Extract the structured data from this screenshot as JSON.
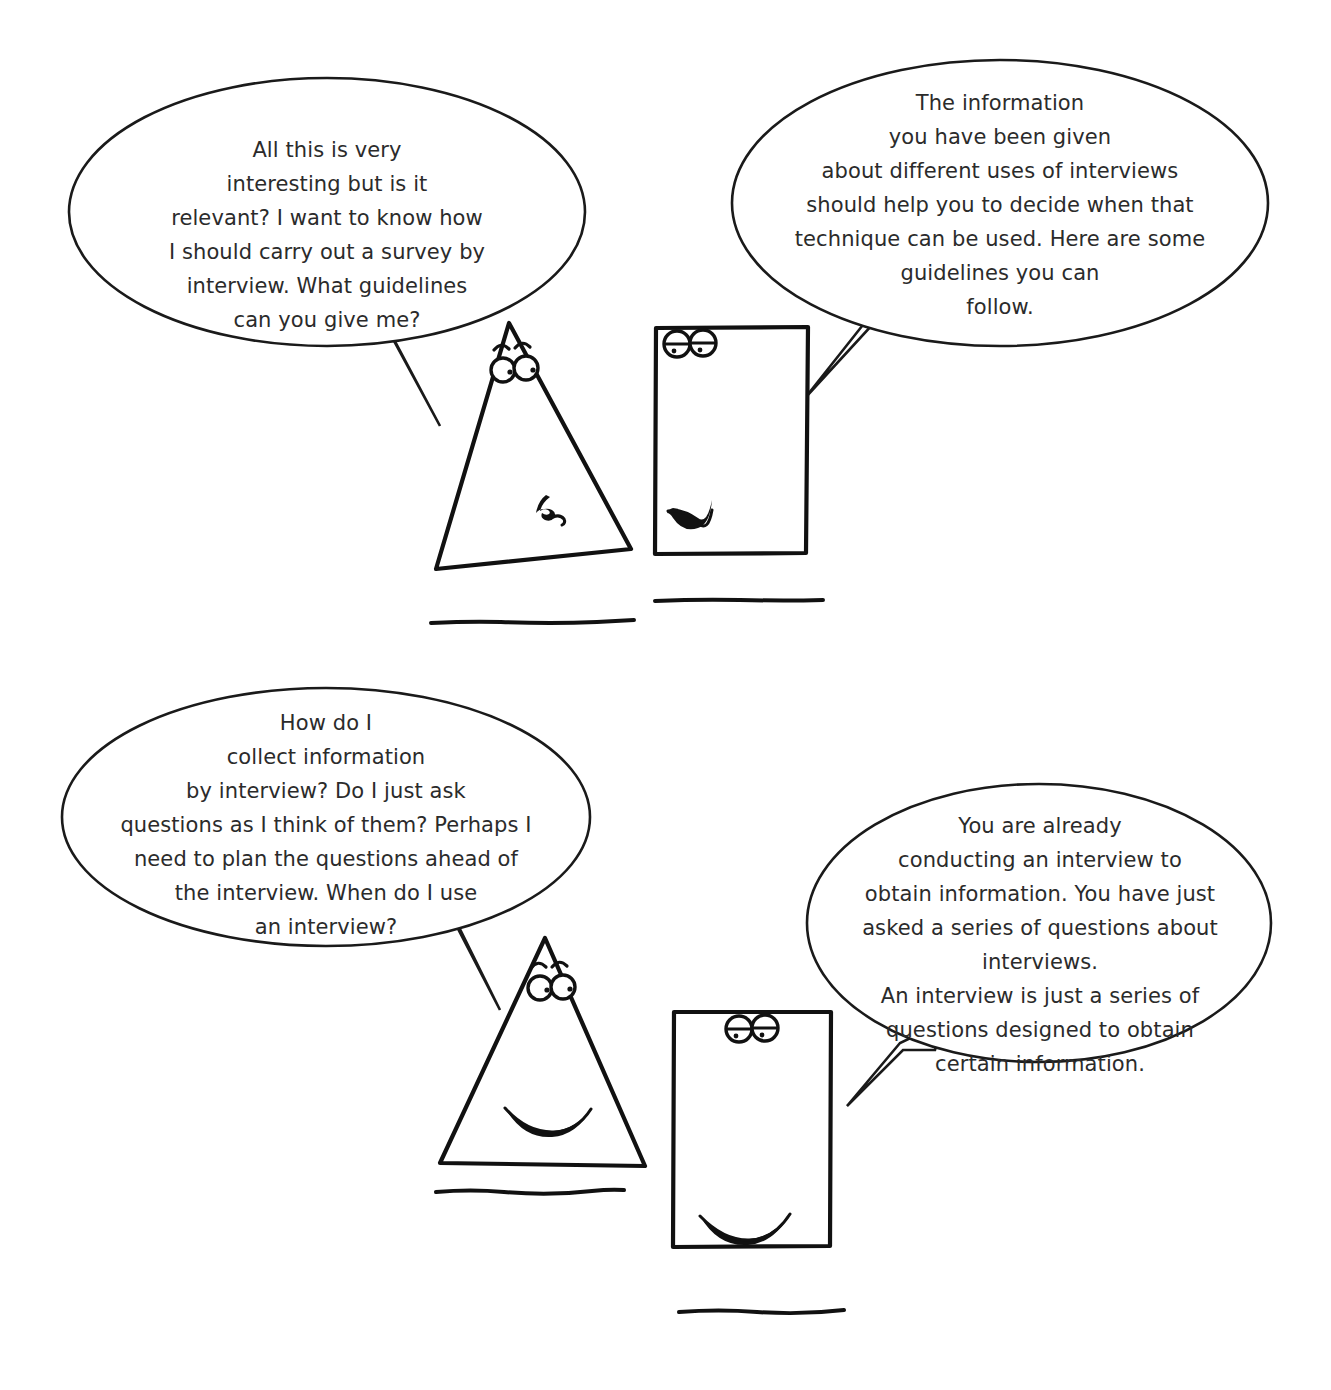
{
  "page": {
    "background_color": "#ffffff",
    "ink_color": "#111111",
    "text_color": "#2b2b2b"
  },
  "panels": [
    {
      "id": "panel-top",
      "bubbles": [
        {
          "id": "bubble-top-left",
          "speaker": "triangle",
          "role": "question",
          "text": "All this is very\ninteresting but is it\nrelevant? I want to know how\nI should carry out a survey by\ninterview. What guidelines\ncan you give me?"
        },
        {
          "id": "bubble-top-right",
          "speaker": "square",
          "role": "answer",
          "text": "The information\nyou have been given\nabout different uses of interviews\nshould help you to decide when that\ntechnique can be used. Here are some\nguidelines you can\nfollow."
        }
      ],
      "characters": [
        {
          "id": "triangle-top",
          "shape": "triangle",
          "expression": "puzzled",
          "eyes": "open-with-eyebrows",
          "mouth": "squiggle"
        },
        {
          "id": "square-top",
          "shape": "square",
          "expression": "speaking",
          "eyes": "half-closed",
          "mouth": "open-smile"
        }
      ]
    },
    {
      "id": "panel-bottom",
      "bubbles": [
        {
          "id": "bubble-bottom-left",
          "speaker": "triangle",
          "role": "question",
          "text": "How do I\ncollect information\nby interview? Do I just ask\nquestions as I think of them? Perhaps I\nneed to plan the questions ahead of\nthe interview. When do I use\nan interview?"
        },
        {
          "id": "bubble-bottom-right",
          "speaker": "square",
          "role": "answer",
          "text": "You are already\nconducting an interview to\nobtain information. You have just\nasked a series of questions about interviews.\nAn interview is just a series of\nquestions designed to obtain\ncertain information."
        }
      ],
      "characters": [
        {
          "id": "triangle-bottom",
          "shape": "triangle",
          "expression": "happy",
          "eyes": "open-with-eyebrows",
          "mouth": "smile"
        },
        {
          "id": "square-bottom",
          "shape": "square",
          "expression": "happy",
          "eyes": "half-closed",
          "mouth": "smile"
        }
      ]
    }
  ]
}
